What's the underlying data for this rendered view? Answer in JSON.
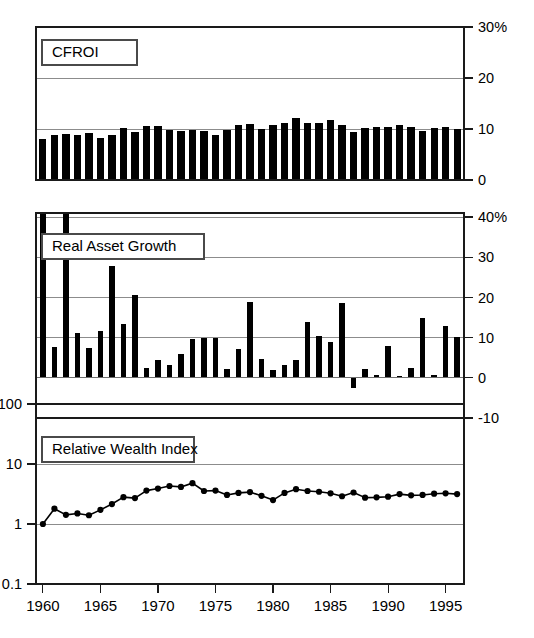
{
  "figure": {
    "background": "#ffffff",
    "ink": "#000000",
    "gridline_color": "#8c8c8c"
  },
  "x_axis": {
    "label": "",
    "tick_labels": [
      "1960",
      "1965",
      "1970",
      "1975",
      "1980",
      "1985",
      "1990",
      "1995"
    ],
    "tick_values": [
      1960,
      1965,
      1970,
      1975,
      1980,
      1985,
      1990,
      1995
    ],
    "range": [
      1959.4,
      1996.6
    ]
  },
  "panels": [
    {
      "id": "cfroi",
      "label": "CFROI",
      "axis_side": "right",
      "tick_labels": [
        "30%",
        "20",
        "10",
        "0"
      ],
      "tick_values": [
        30,
        20,
        10,
        0
      ]
    },
    {
      "id": "real-asset-growth",
      "label": "Real Asset Growth",
      "axis_side": "right",
      "tick_labels": [
        "40%",
        "30",
        "20",
        "10",
        "0",
        "-10"
      ],
      "tick_values": [
        40,
        30,
        20,
        10,
        0,
        -10
      ]
    },
    {
      "id": "relative-wealth-index",
      "label": "Relative Wealth Index",
      "axis_side": "left",
      "tick_labels": [
        "100",
        "10",
        "1",
        "0.1"
      ],
      "tick_values": [
        100,
        10,
        1,
        0.1
      ]
    }
  ],
  "chart_data": [
    {
      "type": "bar",
      "id": "cfroi",
      "title": "CFROI",
      "xlabel": "",
      "ylabel": "CFROI",
      "yunit": "%",
      "ylim": [
        0,
        30
      ],
      "yticks": [
        0,
        10,
        20,
        30
      ],
      "grid": true,
      "legend": "none",
      "bar_color": "#000000",
      "categories": [
        1960,
        1961,
        1962,
        1963,
        1964,
        1965,
        1966,
        1967,
        1968,
        1969,
        1970,
        1971,
        1972,
        1973,
        1974,
        1975,
        1976,
        1977,
        1978,
        1979,
        1980,
        1981,
        1982,
        1983,
        1984,
        1985,
        1986,
        1987,
        1988,
        1989,
        1990,
        1991,
        1992,
        1993,
        1994,
        1995,
        1996
      ],
      "values": [
        8.1,
        8.8,
        9.1,
        8.9,
        9.2,
        8.2,
        8.9,
        10.2,
        9.4,
        10.6,
        10.5,
        9.9,
        9.6,
        9.9,
        9.6,
        8.8,
        9.8,
        10.8,
        10.9,
        10.0,
        10.7,
        11.2,
        12.2,
        11.1,
        11.1,
        11.7,
        10.8,
        9.5,
        10.2,
        10.3,
        10.3,
        10.7,
        10.4,
        9.6,
        10.1,
        10.3,
        10.0
      ]
    },
    {
      "type": "bar",
      "id": "real-asset-growth",
      "title": "Real Asset Growth",
      "xlabel": "",
      "ylabel": "Real Asset Growth",
      "yunit": "%",
      "ylim": [
        -10,
        41
      ],
      "yticks": [
        -10,
        0,
        10,
        20,
        30,
        40
      ],
      "grid": true,
      "legend": "none",
      "bar_color": "#000000",
      "categories": [
        1960,
        1961,
        1962,
        1963,
        1964,
        1965,
        1966,
        1967,
        1968,
        1969,
        1970,
        1971,
        1972,
        1973,
        1974,
        1975,
        1976,
        1977,
        1978,
        1979,
        1980,
        1981,
        1982,
        1983,
        1984,
        1985,
        1986,
        1987,
        1988,
        1989,
        1990,
        1991,
        1992,
        1993,
        1994,
        1995,
        1996
      ],
      "values": [
        41.0,
        7.6,
        41.0,
        11.1,
        7.3,
        11.6,
        27.8,
        13.4,
        20.5,
        2.5,
        4.4,
        3.1,
        6.0,
        9.6,
        9.9,
        10.0,
        2.3,
        7.1,
        18.8,
        4.8,
        2.0,
        3.1,
        4.5,
        13.8,
        10.4,
        9.0,
        18.6,
        -2.5,
        2.2,
        0.7,
        8.0,
        0.4,
        2.5,
        14.9,
        0.8,
        13.0,
        10.2
      ]
    },
    {
      "type": "line",
      "id": "relative-wealth-index",
      "title": "Relative Wealth Index",
      "xlabel": "",
      "ylabel": "Relative Wealth Index",
      "yscale": "log",
      "ylim": [
        0.1,
        100
      ],
      "yticks": [
        0.1,
        1,
        10,
        100
      ],
      "grid": true,
      "legend": "none",
      "line_color": "#000000",
      "marker": "circle",
      "x": [
        1960,
        1961,
        1962,
        1963,
        1964,
        1965,
        1966,
        1967,
        1968,
        1969,
        1970,
        1971,
        1972,
        1973,
        1974,
        1975,
        1976,
        1977,
        1978,
        1979,
        1980,
        1981,
        1982,
        1983,
        1984,
        1985,
        1986,
        1987,
        1988,
        1989,
        1990,
        1991,
        1992,
        1993,
        1994,
        1995,
        1996
      ],
      "values": [
        1.0,
        1.8,
        1.42,
        1.5,
        1.4,
        1.72,
        2.15,
        2.8,
        2.7,
        3.6,
        3.9,
        4.3,
        4.15,
        4.8,
        3.55,
        3.6,
        3.05,
        3.3,
        3.4,
        2.95,
        2.5,
        3.3,
        3.8,
        3.55,
        3.45,
        3.25,
        2.9,
        3.35,
        2.75,
        2.78,
        2.85,
        3.15,
        3.0,
        3.05,
        3.2,
        3.25,
        3.15
      ]
    }
  ]
}
